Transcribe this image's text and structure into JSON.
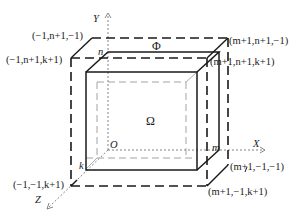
{
  "diagram": {
    "type": "3d-grid-domain",
    "axes": {
      "x_label": "X",
      "y_label": "Y",
      "z_label": "Z",
      "origin_label": "O"
    },
    "regions": {
      "inner": "Ω",
      "outer": "Φ"
    },
    "index_labels": {
      "n": "n",
      "m": "m",
      "k": "k"
    },
    "corner_labels": {
      "top_back_left": "(−1,n+1,−1)",
      "top_front_left": "(−1,n+1,k+1)",
      "top_back_right": "(m+1,n+1,−1)",
      "top_front_right": "(m+1,n+1,k+1)",
      "bottom_front_left": "(−1,−1,k+1)",
      "bottom_back_right": "(m+1,−1,−1)",
      "bottom_front_right": "(m+1,−1,k+1)"
    },
    "colors": {
      "line": "#1a1a1a",
      "axis": "#555555",
      "inner_dash": "#888888"
    }
  }
}
